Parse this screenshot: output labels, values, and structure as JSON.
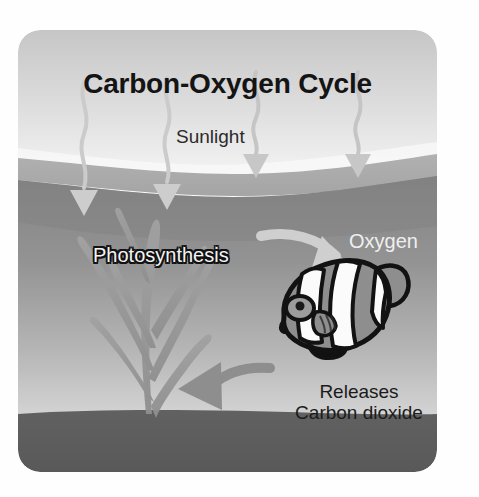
{
  "diagram": {
    "title": "Carbon-Oxygen Cycle",
    "labels": {
      "sunlight": "Sunlight",
      "photosynthesis": "Photosynthesis",
      "oxygen": "Oxygen",
      "releases": "Releases",
      "carbon_dioxide": "Carbon dioxide"
    },
    "elements": {
      "sky": "sky-region",
      "water": "water-region",
      "seabed": "seabed-region",
      "seaweed": "seaweed-plant",
      "fish": "clownfish",
      "sunlight_rays": [
        "sun-ray-1",
        "sun-ray-2",
        "sun-ray-3",
        "sun-ray-4"
      ],
      "oxygen_arrow": "oxygen-arrow",
      "co2_arrow": "carbon-dioxide-arrow"
    },
    "colors": {
      "page_background": "#fefefe",
      "sky_top": "#c8c8c8",
      "sky_bottom": "#f2f2f2",
      "water_top": "#8c8c8c",
      "water_bottom": "#d2d2d2",
      "seabed": "#5f5f5f",
      "seaweed": "#9a9a9a",
      "ray": "#cfcfcf",
      "oxygen_arrow": "#cbcbcb",
      "co2_arrow": "#8e8e8e",
      "title_text": "#141414",
      "fish_outline": "#121212",
      "fish_body": "#8a8a8a",
      "fish_stripe": "#fbfbfb"
    }
  }
}
